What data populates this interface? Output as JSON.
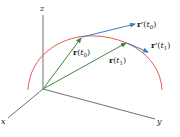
{
  "diagram": {
    "axes": {
      "x_label": "x",
      "y_label": "y",
      "z_label": "z"
    },
    "vectors": [
      {
        "name": "r",
        "param": "t",
        "sub": "0",
        "text": "r(t0)"
      },
      {
        "name": "r",
        "param": "t",
        "sub": "1",
        "text": "r(t1)"
      }
    ],
    "tangents": [
      {
        "name": "r′",
        "param": "t",
        "sub": "0",
        "text": "r′(t0)"
      },
      {
        "name": "r′",
        "param": "t",
        "sub": "1",
        "text": "r′(t1)"
      }
    ],
    "colors": {
      "axes": "#333333",
      "curve": "#e04a3f",
      "position_vectors": "#3a8a3a",
      "tangent_vectors": "#3a7fc8"
    }
  }
}
